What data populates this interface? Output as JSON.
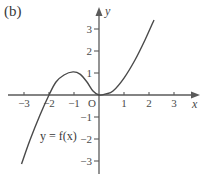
{
  "panel_label": "(b)",
  "chart_data": {
    "type": "line",
    "title": "",
    "xlabel": "x",
    "ylabel": "y",
    "xlim": [
      -3.5,
      3.9
    ],
    "ylim": [
      -3.6,
      3.9
    ],
    "x_ticks": [
      -3,
      -2,
      -1,
      1,
      2,
      3
    ],
    "x_tick_labels": [
      "−3",
      "−2",
      "−1",
      "1",
      "2",
      "3"
    ],
    "y_ticks": [
      -3,
      -2,
      -1,
      1,
      2,
      3
    ],
    "y_tick_labels": [
      "−3",
      "−2",
      "−1",
      "1",
      "2",
      "3"
    ],
    "origin_label": "O",
    "grid": false,
    "legend": [],
    "annotations": [
      {
        "text": "y = f(x)",
        "x": -2.2,
        "y": -1.9
      }
    ],
    "series": [
      {
        "name": "y = f(x)",
        "x": [
          -3.1,
          -2.76,
          -2.36,
          -2.0,
          -1.72,
          -1.4,
          -1.04,
          -0.76,
          -0.48,
          -0.24,
          0.0,
          0.28,
          0.56,
          1.0,
          1.44,
          1.84,
          2.2
        ],
        "y": [
          -3.14,
          -2.05,
          -0.91,
          0.0,
          0.59,
          0.91,
          1.05,
          0.95,
          0.59,
          0.18,
          0.0,
          0.05,
          0.18,
          0.77,
          1.59,
          2.5,
          3.41
        ]
      }
    ]
  }
}
